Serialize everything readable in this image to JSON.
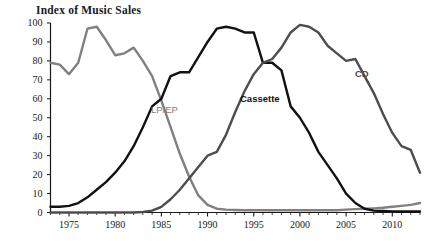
{
  "chart_data": {
    "type": "line",
    "title": "Index of Music Sales",
    "xlabel": "",
    "ylabel": "",
    "xlim": [
      1973,
      2013
    ],
    "ylim": [
      0,
      100
    ],
    "grid": false,
    "legend_position": "inline-annotations",
    "yticks": [
      0,
      10,
      20,
      30,
      40,
      50,
      60,
      70,
      80,
      90,
      100
    ],
    "ytick_labels": [
      "0",
      "10",
      "20",
      "30",
      "40",
      "50",
      "60",
      "70",
      "80",
      "90",
      "100"
    ],
    "xticks": [
      1975,
      1980,
      1985,
      1990,
      1995,
      2000,
      2005,
      2010
    ],
    "xtick_labels": [
      "1975",
      "1980",
      "1985",
      "1990",
      "1995",
      "2000",
      "2005",
      "2010"
    ],
    "x": [
      1973,
      1974,
      1975,
      1976,
      1977,
      1978,
      1979,
      1980,
      1981,
      1982,
      1983,
      1984,
      1985,
      1986,
      1987,
      1988,
      1989,
      1990,
      1991,
      1992,
      1993,
      1994,
      1995,
      1996,
      1997,
      1998,
      1999,
      2000,
      2001,
      2002,
      2003,
      2004,
      2005,
      2006,
      2007,
      2008,
      2009,
      2010,
      2011,
      2012,
      2013
    ],
    "series": [
      {
        "name": "LP/EP",
        "color": "#808080",
        "label_x": 1986,
        "label_y": 50,
        "values": [
          79,
          78,
          73,
          79,
          97,
          98,
          91,
          83,
          84,
          87,
          80,
          72,
          59,
          45,
          31,
          19,
          9,
          4,
          2,
          1.5,
          1.3,
          1.2,
          1.2,
          1.2,
          1.2,
          1.2,
          1.2,
          1.2,
          1.2,
          1.2,
          1.2,
          1.2,
          1.5,
          1.8,
          2,
          2.2,
          2.5,
          3,
          3.5,
          4,
          5
        ]
      },
      {
        "name": "Cassette",
        "color": "#111111",
        "label_x": 1996,
        "label_y": 62,
        "values": [
          3,
          3,
          3.5,
          5,
          8,
          12,
          16,
          21,
          27,
          35,
          45,
          56,
          60,
          72,
          74,
          74,
          82,
          90,
          97,
          98,
          97,
          95,
          95,
          79,
          79,
          75,
          56,
          50,
          42,
          32,
          25,
          18,
          10,
          5,
          2,
          1,
          0.8,
          0.6,
          0.5,
          0.5,
          0.5
        ]
      },
      {
        "name": "CD",
        "color": "#4d4d4d",
        "label_x": 2007,
        "label_y": 72,
        "values": [
          0,
          0,
          0,
          0,
          0,
          0,
          0,
          0,
          0,
          0,
          0.3,
          1,
          3,
          7,
          12,
          18,
          24,
          30,
          32,
          41,
          53,
          64,
          73,
          79,
          81,
          87,
          95,
          99,
          98,
          95,
          88,
          84,
          80,
          81,
          72,
          63,
          52,
          42,
          35,
          33,
          21
        ]
      }
    ]
  }
}
